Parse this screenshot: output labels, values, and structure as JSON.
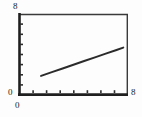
{
  "chart_data": {
    "type": "line",
    "title": "",
    "xlabel": "",
    "ylabel": "",
    "xlim": [
      0,
      8
    ],
    "ylim": [
      0,
      8
    ],
    "grid": false,
    "legend": null,
    "x_ticks": [
      0,
      1,
      2,
      3,
      4,
      5,
      6,
      7,
      8
    ],
    "y_ticks": [
      0,
      1,
      2,
      3,
      4,
      5,
      6,
      7,
      8
    ],
    "x_tick_labels": [
      "0",
      "",
      "",
      "",
      "",
      "",
      "",
      "",
      "8"
    ],
    "y_tick_labels": [
      "0",
      "",
      "",
      "",
      "",
      "",
      "",
      "",
      "8"
    ],
    "series": [
      {
        "name": "series-1",
        "color": "#2b2b2b",
        "linewidth": 2,
        "x": [
          1.6,
          2.4,
          3.2,
          4.0,
          4.8,
          5.6,
          6.4,
          7.2,
          7.7
        ],
        "y": [
          1.87,
          2.24,
          2.61,
          2.98,
          3.35,
          3.72,
          4.09,
          4.46,
          4.69
        ]
      }
    ]
  },
  "axes": {
    "y_max_label": "8",
    "y_min_label": "0",
    "x_min_label": "0",
    "x_max_label": "8"
  },
  "colors": {
    "line": "#2b2b2b",
    "frame": "#3a3a3a",
    "axis": "#1f1f1f",
    "background": "#fdfdfd",
    "tick": "#2e2e2e"
  }
}
